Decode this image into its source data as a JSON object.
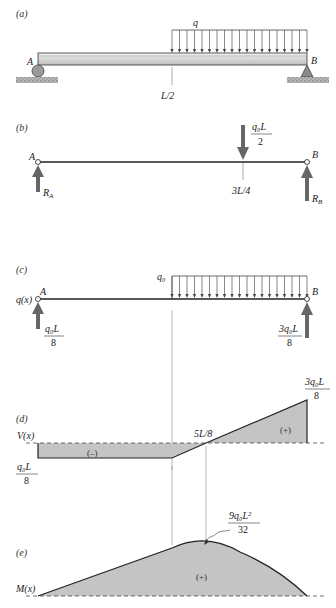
{
  "panels": {
    "a": {
      "label": "(a)",
      "point_A": "A",
      "point_B": "B",
      "load_label": "q",
      "midpoint_label": "L/2"
    },
    "b": {
      "label": "(b)",
      "point_A": "A",
      "point_B": "B",
      "resultant_num": "q₀L",
      "resultant_den": "2",
      "resultant_pos": "3L/4",
      "reaction_A": "R",
      "reaction_A_sub": "A",
      "reaction_B": "R",
      "reaction_B_sub": "B"
    },
    "c": {
      "label": "(c)",
      "axis_label": "q(x)",
      "point_A": "A",
      "point_B": "B",
      "load_label": "q₀",
      "reaction_A_num": "q₀L",
      "reaction_A_den": "8",
      "reaction_B_num": "3q₀L",
      "reaction_B_den": "8"
    },
    "d": {
      "label": "(d)",
      "axis_label": "V(x)",
      "neg_value_num": "q₀L",
      "neg_value_den": "8",
      "pos_value_num": "3q₀L",
      "pos_value_den": "8",
      "zero_crossing": "5L/8",
      "neg_sign": "(–)",
      "pos_sign": "(+)"
    },
    "e": {
      "label": "(e)",
      "axis_label": "M(x)",
      "max_num": "9q₀L²",
      "max_den": "32",
      "pos_sign": "(+)"
    }
  },
  "colors": {
    "ink": "#222222",
    "fill_gray": "#c4c4c4",
    "arrow_gray": "#666666",
    "beam_light": "#e2e2e2",
    "ground": "#9a9a9a",
    "guide": "#9a9a9a"
  },
  "chart_data": [
    {
      "type": "area",
      "title": "Shear force diagram V(x)",
      "ylabel": "V(x)",
      "x": [
        "0",
        "L/2",
        "5L/8",
        "L"
      ],
      "values": [
        -0.125,
        -0.125,
        0,
        0.375
      ],
      "units": "q0*L",
      "annotations": [
        "-q0L/8",
        "5L/8",
        "3q0L/8",
        "(-)",
        "(+)"
      ]
    },
    {
      "type": "area",
      "title": "Bending moment diagram M(x)",
      "ylabel": "M(x)",
      "x": [
        "0",
        "L/2",
        "5L/8",
        "L"
      ],
      "values": [
        0,
        0.25,
        0.28125,
        0
      ],
      "units": "q0*L^2 / 4 scale (max 9q0L^2/32 at 5L/8)",
      "annotations": [
        "9q0L^2/32",
        "(+)"
      ]
    }
  ]
}
